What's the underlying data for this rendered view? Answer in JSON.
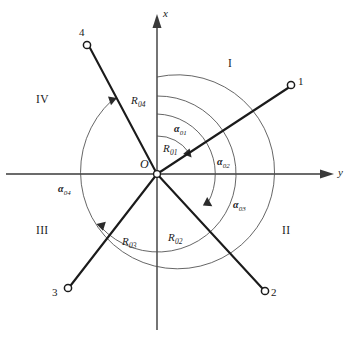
{
  "figure": {
    "background_color": "#ffffff",
    "line_color": "#1b1b1b",
    "axis_color": "#3a3a3a",
    "arc_color": "#4a4a4a"
  },
  "axes": {
    "vertical": {
      "label": "x",
      "direction": "up"
    },
    "horizontal": {
      "label": "y",
      "direction": "right"
    },
    "origin": {
      "label": "O",
      "x": 157,
      "y": 174
    }
  },
  "quadrants": [
    {
      "id": "I",
      "label": "I",
      "position": "upper-right"
    },
    {
      "id": "II",
      "label": "II",
      "position": "lower-right"
    },
    {
      "id": "III",
      "label": "III",
      "position": "lower-left"
    },
    {
      "id": "IV",
      "label": "IV",
      "position": "upper-left"
    }
  ],
  "nodes": [
    {
      "id": "1",
      "label": "1",
      "quadrant": "I",
      "x": 293,
      "y": 84
    },
    {
      "id": "2",
      "label": "2",
      "quadrant": "II",
      "x": 266,
      "y": 293
    },
    {
      "id": "3",
      "label": "3",
      "quadrant": "III",
      "x": 66,
      "y": 290
    },
    {
      "id": "4",
      "label": "4",
      "quadrant": "IV",
      "x": 86,
      "y": 43
    }
  ],
  "radii": [
    {
      "id": "R01",
      "label": "R",
      "sub": "01",
      "value": 38,
      "node": "1"
    },
    {
      "id": "R02",
      "label": "R",
      "sub": "02",
      "value": 60,
      "node": "2"
    },
    {
      "id": "R03",
      "label": "R",
      "sub": "03",
      "value": 78,
      "node": "3"
    },
    {
      "id": "R04",
      "label": "R",
      "sub": "04",
      "value": 97,
      "node": "4"
    }
  ],
  "angles": [
    {
      "id": "a01",
      "label": "α",
      "sub": "01",
      "node": "1",
      "from_axis": "+x",
      "sweep": "clockwise"
    },
    {
      "id": "a02",
      "label": "α",
      "sub": "02",
      "node": "2",
      "from_axis": "+x",
      "sweep": "clockwise"
    },
    {
      "id": "a03",
      "label": "α",
      "sub": "03",
      "node": "3",
      "from_axis": "+x",
      "sweep": "clockwise"
    },
    {
      "id": "a04",
      "label": "α",
      "sub": "04",
      "node": "4",
      "from_axis": "+x",
      "sweep": "clockwise"
    }
  ]
}
